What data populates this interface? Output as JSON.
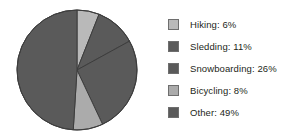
{
  "chart_data": {
    "type": "pie",
    "title": "",
    "subtitle": "",
    "xlabel": "",
    "ylabel": "",
    "grid": false,
    "legend_position": "right",
    "start_angle_deg": 0,
    "direction": "clockwise",
    "categories": [
      "Hiking",
      "Sledding",
      "Snowboarding",
      "Bicycling",
      "Other"
    ],
    "values": [
      6,
      11,
      26,
      8,
      49
    ],
    "unit": "%",
    "slice_colors": [
      "#b9b9b9",
      "#5a5a5a",
      "#5a5a5a",
      "#ababab",
      "#5a5a5a"
    ],
    "slice_border_color": "#3d3d3d",
    "slices": [
      {
        "label": "Hiking",
        "value": 6,
        "display": "Hiking: 6%",
        "color": "#b9b9b9"
      },
      {
        "label": "Sledding",
        "value": 11,
        "display": "Sledding: 11%",
        "color": "#5a5a5a"
      },
      {
        "label": "Snowboarding",
        "value": 26,
        "display": "Snowboarding: 26%",
        "color": "#5a5a5a"
      },
      {
        "label": "Bicycling",
        "value": 8,
        "display": "Bicycling: 8%",
        "color": "#ababab"
      },
      {
        "label": "Other",
        "value": 49,
        "display": "Other: 49%",
        "color": "#5a5a5a"
      }
    ]
  },
  "legend": {
    "items": [
      {
        "label": "Hiking: 6%",
        "color": "#b9b9b9"
      },
      {
        "label": "Sledding: 11%",
        "color": "#5a5a5a"
      },
      {
        "label": "Snowboarding: 26%",
        "color": "#5a5a5a"
      },
      {
        "label": "Bicycling: 8%",
        "color": "#ababab"
      },
      {
        "label": "Other: 49%",
        "color": "#5a5a5a"
      }
    ]
  },
  "colors": {
    "background": "#ffffff",
    "text": "#231f20",
    "light_gray": "#b9b9b9",
    "mid_gray": "#ababab",
    "dark_gray": "#5a5a5a",
    "outline": "#3d3d3d",
    "swatch_border": "#6e6e6e"
  }
}
